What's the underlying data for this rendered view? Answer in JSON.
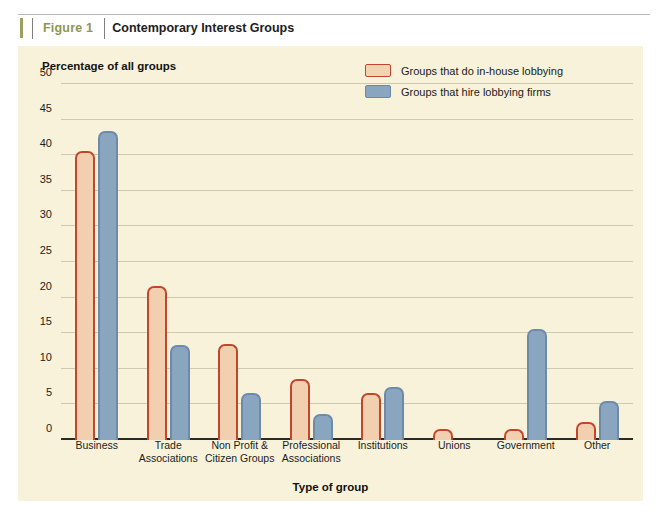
{
  "figure": {
    "label": "Figure 1",
    "title": "Contemporary Interest Groups"
  },
  "colors": {
    "panel_background": "#f8f2da",
    "inhouse_fill": "#f2d0af",
    "inhouse_border": "#c2462b",
    "firms_fill": "#8aa5c0",
    "firms_border": "#6d8ba8",
    "gridline": "#cfc9ad",
    "axis": "#2a2a2a",
    "figure_label": "#8d9652"
  },
  "legend": {
    "position": "top-right",
    "entries": [
      {
        "label": "Groups that do in-house lobbying",
        "swatch": "inhouse"
      },
      {
        "label": "Groups that hire lobbying firms",
        "swatch": "firms"
      }
    ]
  },
  "chart_data": {
    "type": "bar",
    "title": "Contemporary Interest Groups",
    "subtitle": "",
    "xlabel": "Type of group",
    "ylabel": "Percentage of all groups",
    "ylim": [
      0,
      50
    ],
    "yticks": [
      0,
      5,
      10,
      15,
      20,
      25,
      30,
      35,
      40,
      45,
      50
    ],
    "ytick_labels": [
      "0",
      "5",
      "10",
      "15",
      "20",
      "25",
      "30",
      "35",
      "40",
      "45",
      "50"
    ],
    "grid": true,
    "legend_position": "top-right",
    "categories": [
      "Business",
      "Trade Associations",
      "Non Profit & Citizen Groups",
      "Professional Associations",
      "Institutions",
      "Unions",
      "Government",
      "Other"
    ],
    "category_lines": [
      [
        "Business"
      ],
      [
        "Trade",
        "Associations"
      ],
      [
        "Non Profit &",
        "Citizen Groups"
      ],
      [
        "Professional",
        "Associations"
      ],
      [
        "Institutions"
      ],
      [
        "Unions"
      ],
      [
        "Government"
      ],
      [
        "Other"
      ]
    ],
    "series": [
      {
        "name": "Groups that do in-house lobbying",
        "values": [
          40.6,
          21.7,
          13.5,
          8.6,
          6.6,
          1.5,
          1.5,
          2.5
        ]
      },
      {
        "name": "Groups that hire lobbying firms",
        "values": [
          43.4,
          13.4,
          6.6,
          3.6,
          7.4,
          0,
          15.6,
          5.5
        ]
      }
    ]
  }
}
